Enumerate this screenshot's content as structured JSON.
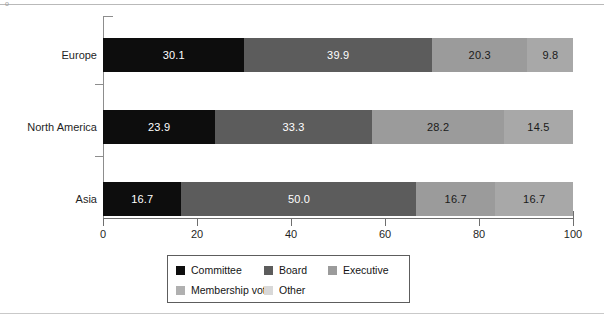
{
  "figure": {
    "corner_mark": "o",
    "background": "#ffffff"
  },
  "chart_data": {
    "type": "bar",
    "orientation": "horizontal",
    "stacked": true,
    "title": "",
    "subtitle": "",
    "xlabel": "",
    "ylabel": "",
    "xlim": [
      0,
      100
    ],
    "xticks": [
      0,
      20,
      40,
      60,
      80,
      100
    ],
    "xtick_labels": [
      "0",
      "20",
      "40",
      "60",
      "80",
      "100"
    ],
    "grid": false,
    "legend_position": "bottom",
    "categories": [
      "Europe",
      "North America",
      "Asia"
    ],
    "series": [
      {
        "name": "Committee",
        "color": "#0d0d0d",
        "label_color": "#ffffff",
        "values": [
          30.1,
          23.9,
          16.7
        ],
        "value_labels": [
          "30.1",
          "23.9",
          "16.7"
        ]
      },
      {
        "name": "Board",
        "color": "#5c5c5c",
        "label_color": "#ffffff",
        "values": [
          39.9,
          33.3,
          50.0
        ],
        "value_labels": [
          "39.9",
          "33.3",
          "50.0"
        ]
      },
      {
        "name": "Executive",
        "color": "#9b9b9b",
        "label_color": "#1a1a1a",
        "values": [
          20.3,
          28.2,
          16.7
        ],
        "value_labels": [
          "20.3",
          "28.2",
          "16.7"
        ]
      },
      {
        "name": "Membership vote",
        "color": "#a8a8a8",
        "label_color": "#1a1a1a",
        "values": [
          9.8,
          14.5,
          16.7
        ],
        "value_labels": [
          "9.8",
          "14.5",
          "16.7"
        ]
      },
      {
        "name": "Other",
        "color": "#cfcfcf",
        "label_color": "#1a1a1a",
        "values": [
          0,
          0,
          0
        ],
        "value_labels": [
          "",
          "",
          ""
        ]
      }
    ],
    "legend_entries": [
      {
        "label": "Committee",
        "color": "#0d0d0d"
      },
      {
        "label": "Board",
        "color": "#5c5c5c"
      },
      {
        "label": "Executive",
        "color": "#9b9b9b"
      },
      {
        "label": "Membership vote",
        "color": "#b0b0b0"
      },
      {
        "label": "Other",
        "color": "#d8d8d8"
      }
    ]
  }
}
